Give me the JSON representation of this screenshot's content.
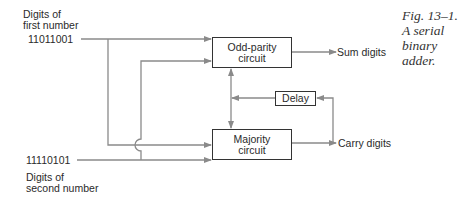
{
  "diagram": {
    "inputs": {
      "first": {
        "label_line1": "Digits of",
        "label_line2": "first number",
        "value": "11011001"
      },
      "second": {
        "value": "11110101",
        "label_line1": "Digits of",
        "label_line2": "second number"
      }
    },
    "blocks": {
      "odd_parity": {
        "line1": "Odd-parity",
        "line2": "circuit"
      },
      "majority": {
        "line1": "Majority",
        "line2": "circuit"
      },
      "delay": {
        "label": "Delay"
      }
    },
    "outputs": {
      "sum": "Sum digits",
      "carry": "Carry digits"
    },
    "caption": {
      "line1": "Fig. 13–1.",
      "line2": "A serial",
      "line3": "binary",
      "line4": "adder."
    },
    "colors": {
      "line": "#8a8a8a",
      "box_border": "#333333",
      "text": "#2a2a2a"
    }
  }
}
